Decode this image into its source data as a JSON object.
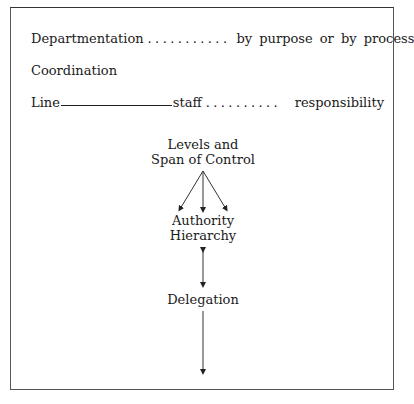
{
  "rows": {
    "departmentation": {
      "label": "Departmentation",
      "dots": "...........",
      "right": "by purpose or by process"
    },
    "coordination": {
      "label": "Coordination"
    },
    "line_staff": {
      "left": "Line",
      "middle": "staff",
      "dots": "..........",
      "right": "responsibility"
    }
  },
  "diagram": {
    "levels": {
      "line1": "Levels and",
      "line2": "Span of Control"
    },
    "authority": {
      "line1": "Authority",
      "line2": "Hierarchy"
    },
    "delegation": {
      "label": "Delegation"
    }
  }
}
